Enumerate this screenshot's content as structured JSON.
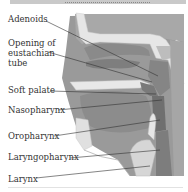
{
  "figure": {
    "header_band": "",
    "colors": {
      "background": "#ffffff",
      "tissue": "#8f8f8f",
      "tissue_light": "#a9a9a9",
      "cartilage": "#e4e4e4",
      "airway": "#6e6e6e",
      "leader_line": "#333333",
      "label_text": "#333333"
    },
    "labels": [
      {
        "id": "adenoids",
        "text": "Adenoids"
      },
      {
        "id": "eustachian-1",
        "text": "Opening of"
      },
      {
        "id": "eustachian-2",
        "text": "eustachian"
      },
      {
        "id": "eustachian-3",
        "text": "tube"
      },
      {
        "id": "soft-palate",
        "text": "Soft palate"
      },
      {
        "id": "nasopharynx",
        "text": "Nasopharynx"
      },
      {
        "id": "oropharynx",
        "text": "Oropharynx"
      },
      {
        "id": "laryngopharynx",
        "text": "Laryngopharynx"
      },
      {
        "id": "larynx",
        "text": "Larynx"
      }
    ]
  }
}
